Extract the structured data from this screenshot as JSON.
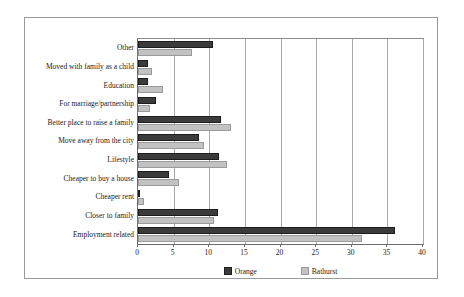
{
  "chart_data": {
    "type": "bar",
    "orientation": "horizontal",
    "title": "",
    "xlabel": "",
    "ylabel": "",
    "xlim": [
      0,
      40
    ],
    "xticks": [
      0,
      5,
      10,
      15,
      20,
      25,
      30,
      35,
      40
    ],
    "grid": "vertical",
    "legend_position": "bottom-center",
    "categories": [
      "Employment related",
      "Closer to family",
      "Cheaper rent",
      "Cheaper to buy a house",
      "Lifestyle",
      "Move away from the city",
      "Better place to raise a family",
      "For marriage/partnership",
      "Education",
      "Moved with family as a child",
      "Other"
    ],
    "series": [
      {
        "name": "Orange",
        "color": "#3b3b3b",
        "values": [
          36.0,
          11.2,
          0.2,
          4.3,
          11.3,
          8.5,
          11.6,
          2.5,
          1.4,
          1.4,
          10.5
        ]
      },
      {
        "name": "Bathurst",
        "color": "#c2c2c2",
        "values": [
          31.5,
          10.6,
          0.8,
          5.8,
          12.5,
          9.3,
          13.0,
          1.7,
          3.5,
          2.0,
          7.6
        ]
      }
    ]
  },
  "legend": {
    "items": [
      {
        "label": "Orange",
        "swatch": "dark-square-swatch"
      },
      {
        "label": "Bathurst",
        "swatch": "light-square-swatch"
      }
    ]
  },
  "axis": {
    "x_tick_labels": [
      "0",
      "5",
      "10",
      "15",
      "20",
      "25",
      "30",
      "35",
      "40"
    ]
  }
}
